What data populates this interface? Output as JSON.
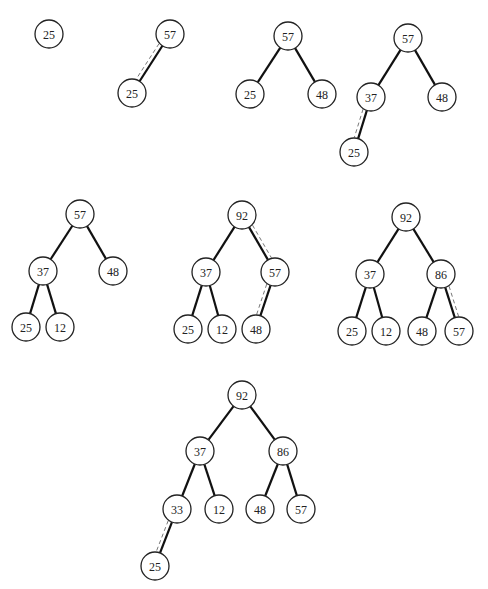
{
  "header": {
    "clipped_text": ""
  },
  "node_radius": 14,
  "trees": [
    {
      "id": "step-1",
      "nodes": [
        {
          "id": "a",
          "label": "25",
          "x": 49,
          "y": 34
        }
      ],
      "edges": []
    },
    {
      "id": "step-2",
      "nodes": [
        {
          "id": "a",
          "label": "57",
          "x": 170,
          "y": 34
        },
        {
          "id": "b",
          "label": "25",
          "x": 132,
          "y": 93
        }
      ],
      "edges": [
        {
          "from": "a",
          "to": "b",
          "swap": true
        }
      ]
    },
    {
      "id": "step-3",
      "nodes": [
        {
          "id": "a",
          "label": "57",
          "x": 288,
          "y": 36
        },
        {
          "id": "b",
          "label": "25",
          "x": 250,
          "y": 94
        },
        {
          "id": "c",
          "label": "48",
          "x": 322,
          "y": 94
        }
      ],
      "edges": [
        {
          "from": "a",
          "to": "b"
        },
        {
          "from": "a",
          "to": "c"
        }
      ]
    },
    {
      "id": "step-4",
      "nodes": [
        {
          "id": "a",
          "label": "57",
          "x": 408,
          "y": 38
        },
        {
          "id": "b",
          "label": "37",
          "x": 371,
          "y": 97
        },
        {
          "id": "c",
          "label": "48",
          "x": 442,
          "y": 97
        },
        {
          "id": "d",
          "label": "25",
          "x": 354,
          "y": 152
        }
      ],
      "edges": [
        {
          "from": "a",
          "to": "b"
        },
        {
          "from": "a",
          "to": "c"
        },
        {
          "from": "b",
          "to": "d",
          "swap": true
        }
      ]
    },
    {
      "id": "step-5",
      "nodes": [
        {
          "id": "a",
          "label": "57",
          "x": 80,
          "y": 214
        },
        {
          "id": "b",
          "label": "37",
          "x": 43,
          "y": 271
        },
        {
          "id": "c",
          "label": "48",
          "x": 113,
          "y": 271
        },
        {
          "id": "d",
          "label": "25",
          "x": 26,
          "y": 327
        },
        {
          "id": "e",
          "label": "12",
          "x": 60,
          "y": 327
        }
      ],
      "edges": [
        {
          "from": "a",
          "to": "b"
        },
        {
          "from": "a",
          "to": "c"
        },
        {
          "from": "b",
          "to": "d"
        },
        {
          "from": "b",
          "to": "e"
        }
      ]
    },
    {
      "id": "step-6",
      "nodes": [
        {
          "id": "a",
          "label": "92",
          "x": 242,
          "y": 215
        },
        {
          "id": "b",
          "label": "37",
          "x": 206,
          "y": 272
        },
        {
          "id": "c",
          "label": "57",
          "x": 275,
          "y": 272
        },
        {
          "id": "d",
          "label": "25",
          "x": 188,
          "y": 329
        },
        {
          "id": "e",
          "label": "12",
          "x": 222,
          "y": 329
        },
        {
          "id": "f",
          "label": "48",
          "x": 256,
          "y": 329
        }
      ],
      "edges": [
        {
          "from": "a",
          "to": "b"
        },
        {
          "from": "a",
          "to": "c",
          "swap": true
        },
        {
          "from": "b",
          "to": "d"
        },
        {
          "from": "b",
          "to": "e"
        },
        {
          "from": "c",
          "to": "f",
          "swap": true
        }
      ]
    },
    {
      "id": "step-7",
      "nodes": [
        {
          "id": "a",
          "label": "92",
          "x": 406,
          "y": 217
        },
        {
          "id": "b",
          "label": "37",
          "x": 370,
          "y": 274
        },
        {
          "id": "c",
          "label": "86",
          "x": 441,
          "y": 274
        },
        {
          "id": "d",
          "label": "25",
          "x": 352,
          "y": 331
        },
        {
          "id": "e",
          "label": "12",
          "x": 386,
          "y": 331
        },
        {
          "id": "f",
          "label": "48",
          "x": 422,
          "y": 331
        },
        {
          "id": "g",
          "label": "57",
          "x": 459,
          "y": 331
        }
      ],
      "edges": [
        {
          "from": "a",
          "to": "b"
        },
        {
          "from": "a",
          "to": "c"
        },
        {
          "from": "b",
          "to": "d"
        },
        {
          "from": "b",
          "to": "e"
        },
        {
          "from": "c",
          "to": "f"
        },
        {
          "from": "c",
          "to": "g",
          "swap": true
        }
      ]
    },
    {
      "id": "step-8",
      "nodes": [
        {
          "id": "a",
          "label": "92",
          "x": 242,
          "y": 395
        },
        {
          "id": "b",
          "label": "37",
          "x": 200,
          "y": 451
        },
        {
          "id": "c",
          "label": "86",
          "x": 283,
          "y": 451
        },
        {
          "id": "d",
          "label": "33",
          "x": 177,
          "y": 509
        },
        {
          "id": "e",
          "label": "12",
          "x": 219,
          "y": 509
        },
        {
          "id": "f",
          "label": "48",
          "x": 260,
          "y": 509
        },
        {
          "id": "g",
          "label": "57",
          "x": 301,
          "y": 509
        },
        {
          "id": "h",
          "label": "25",
          "x": 155,
          "y": 566
        }
      ],
      "edges": [
        {
          "from": "a",
          "to": "b"
        },
        {
          "from": "a",
          "to": "c"
        },
        {
          "from": "b",
          "to": "d"
        },
        {
          "from": "b",
          "to": "e"
        },
        {
          "from": "c",
          "to": "f"
        },
        {
          "from": "c",
          "to": "g"
        },
        {
          "from": "d",
          "to": "h",
          "swap": true
        }
      ]
    }
  ]
}
